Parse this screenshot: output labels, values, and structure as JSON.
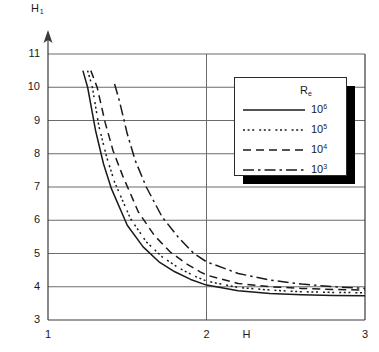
{
  "chart_data": {
    "type": "line",
    "title": "",
    "ylabel": "H1",
    "ylabel_base": "H",
    "ylabel_sub": "1",
    "xlabel": "H",
    "xlim": [
      1,
      3
    ],
    "ylim": [
      3,
      11
    ],
    "xticks": [
      1,
      2,
      3
    ],
    "xtick_labels": [
      "1",
      "2",
      "3"
    ],
    "yticks": [
      3,
      4,
      5,
      6,
      7,
      8,
      9,
      10,
      11
    ],
    "ytick_labels": [
      "3",
      "4",
      "5",
      "6",
      "7",
      "8",
      "9",
      "10",
      "11"
    ],
    "grid": "horizontal gridlines at every integer y; vertical gridline at x=2",
    "axis_arrow": "y-axis arrow at top",
    "legend": {
      "position": "upper-right inside plot",
      "title": "Re",
      "title_base": "R",
      "title_sub": "e",
      "entries": [
        {
          "label": "10^6",
          "mantissa": "10",
          "exponent": "6",
          "style": "solid"
        },
        {
          "label": "10^5",
          "mantissa": "10",
          "exponent": "5",
          "style": "dotted"
        },
        {
          "label": "10^4",
          "mantissa": "10",
          "exponent": "4",
          "style": "dashed"
        },
        {
          "label": "10^3",
          "mantissa": "10",
          "exponent": "3",
          "style": "dash-dot"
        }
      ]
    },
    "series": [
      {
        "name": "10^6",
        "style": "solid",
        "x": [
          1.22,
          1.25,
          1.3,
          1.35,
          1.4,
          1.5,
          1.6,
          1.7,
          1.8,
          1.9,
          2.0,
          2.2,
          2.4,
          2.6,
          2.8,
          3.0
        ],
        "values": [
          10.5,
          10.0,
          8.7,
          7.7,
          6.95,
          5.85,
          5.2,
          4.75,
          4.45,
          4.22,
          4.05,
          3.88,
          3.8,
          3.76,
          3.74,
          3.73
        ]
      },
      {
        "name": "10^5",
        "style": "dotted",
        "x": [
          1.25,
          1.28,
          1.32,
          1.37,
          1.42,
          1.52,
          1.62,
          1.72,
          1.82,
          1.92,
          2.0,
          2.2,
          2.4,
          2.6,
          2.8,
          3.0
        ],
        "values": [
          10.5,
          10.0,
          8.85,
          7.9,
          7.15,
          6.05,
          5.35,
          4.9,
          4.58,
          4.33,
          4.17,
          3.98,
          3.9,
          3.85,
          3.83,
          3.82
        ]
      },
      {
        "name": "10^4",
        "style": "dashed",
        "x": [
          1.27,
          1.31,
          1.36,
          1.41,
          1.47,
          1.57,
          1.67,
          1.77,
          1.87,
          1.96,
          2.0,
          2.2,
          2.4,
          2.6,
          2.8,
          3.0
        ],
        "values": [
          10.5,
          10.0,
          8.95,
          8.1,
          7.35,
          6.25,
          5.55,
          5.05,
          4.7,
          4.45,
          4.35,
          4.1,
          4.0,
          3.95,
          3.92,
          3.9
        ]
      },
      {
        "name": "10^3",
        "style": "dash-dot",
        "x": [
          1.42,
          1.45,
          1.5,
          1.55,
          1.62,
          1.72,
          1.82,
          1.92,
          2.0,
          2.2,
          2.4,
          2.6,
          2.8,
          3.0
        ],
        "values": [
          10.1,
          9.6,
          8.6,
          7.8,
          7.0,
          6.1,
          5.5,
          5.0,
          4.75,
          4.4,
          4.2,
          4.08,
          4.0,
          3.95
        ]
      }
    ],
    "colors": {
      "line": "#1a1a1a",
      "grid": "#6b6b6b",
      "frame": "#3a3a3a",
      "background": "#ffffff",
      "legend_shadow": "#000000"
    }
  }
}
